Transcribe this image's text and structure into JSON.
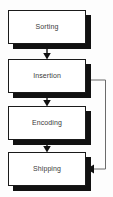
{
  "diagram": {
    "type": "flowchart",
    "background_color": "#fdfdfd",
    "box_fill_color": "#ffffff",
    "box_border_color": "#1a1a1a",
    "shadow_color": "#111111",
    "connector_color": "#6b6b6b",
    "arrow_color": "#111111",
    "label_color": "#3a3a3a",
    "nodes": [
      {
        "id": "sorting",
        "label": "Sorting",
        "x": 8,
        "y": 10,
        "width": 78,
        "height": 34
      },
      {
        "id": "insertion",
        "label": "Insertion",
        "x": 8,
        "y": 59,
        "width": 78,
        "height": 34
      },
      {
        "id": "encoding",
        "label": "Encoding",
        "x": 8,
        "y": 106,
        "width": 78,
        "height": 34
      },
      {
        "id": "shipping",
        "label": "Shipping",
        "x": 8,
        "y": 152,
        "width": 78,
        "height": 34
      }
    ],
    "connectors": [
      {
        "id": "sorting-to-insertion",
        "from": "sorting",
        "to": "insertion",
        "kind": "arrow-down"
      },
      {
        "id": "insertion-to-encoding",
        "from": "insertion",
        "to": "encoding",
        "kind": "arrow-down"
      },
      {
        "id": "encoding-to-shipping",
        "from": "encoding",
        "to": "shipping",
        "kind": "arrow-down"
      },
      {
        "id": "insertion-to-shipping-feedback",
        "from": "insertion",
        "to": "shipping",
        "kind": "routed-arrow-left"
      }
    ]
  }
}
